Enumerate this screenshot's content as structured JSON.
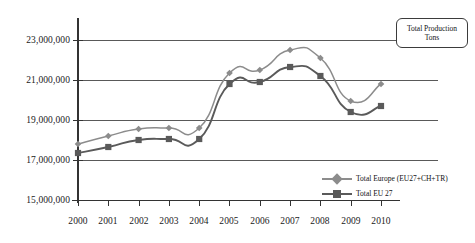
{
  "title_box": {
    "text": "Total Production Tons",
    "line1": "Total Production",
    "line2": "Tons"
  },
  "legend": {
    "position": "inside-bottom-right",
    "items": [
      {
        "label": "Total Europe (EU27+CH+TR)",
        "marker": "diamond",
        "color": "#8c8c8c"
      },
      {
        "label": "Total EU 27",
        "marker": "square",
        "color": "#5a5a5a"
      }
    ]
  },
  "axis": {
    "y_ticks": [
      "15,000,000",
      "17,000,000",
      "19,000,000",
      "21,000,000",
      "23,000,000"
    ],
    "x_ticks": [
      "2000",
      "2001",
      "2002",
      "2003",
      "2004",
      "2005",
      "2006",
      "2007",
      "2008",
      "2009",
      "2010"
    ]
  },
  "colors": {
    "series_europe": "#8c8c8c",
    "series_eu27": "#5a5a5a",
    "gridline": "#595959",
    "axis": "#333333",
    "background": "#ffffff",
    "text": "#111111"
  },
  "chart_data": {
    "type": "line",
    "title": "Total Production Tons",
    "xlabel": "",
    "ylabel": "",
    "x": [
      2000,
      2001,
      2002,
      2003,
      2004,
      2005,
      2006,
      2007,
      2008,
      2009,
      2010
    ],
    "categories": [
      "2000",
      "2001",
      "2002",
      "2003",
      "2004",
      "2005",
      "2006",
      "2007",
      "2008",
      "2009",
      "2010"
    ],
    "ylim": [
      15000000,
      24000000
    ],
    "yticks": [
      15000000,
      17000000,
      19000000,
      21000000,
      23000000
    ],
    "ytick_labels": [
      "15,000,000",
      "17,000,000",
      "19,000,000",
      "21,000,000",
      "23,000,000"
    ],
    "grid": true,
    "grid_axis": "y",
    "legend_position": "inside bottom right",
    "series": [
      {
        "name": "Total Europe (EU27+CH+TR)",
        "marker": "diamond",
        "color": "#8c8c8c",
        "values": [
          17800000,
          18200000,
          18550000,
          18600000,
          18600000,
          21350000,
          21500000,
          22500000,
          22100000,
          19950000,
          20800000
        ]
      },
      {
        "name": "Total EU 27",
        "marker": "square",
        "color": "#5a5a5a",
        "values": [
          17350000,
          17650000,
          18000000,
          18050000,
          18050000,
          20800000,
          20900000,
          21650000,
          21200000,
          19400000,
          19700000
        ]
      }
    ]
  }
}
